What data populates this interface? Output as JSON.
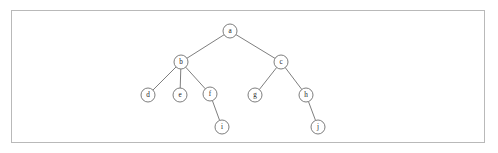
{
  "figure": {
    "type": "tree-diagram",
    "title": "",
    "caption": "",
    "frame": {
      "x": 11,
      "y": 10,
      "width": 474,
      "height": 133,
      "border_color": "#b9b9b9",
      "background_color": "#ffffff"
    },
    "style": {
      "node_fill": "#ffffff",
      "node_stroke": "#6f6f6f",
      "edge_stroke": "#6f6f6f",
      "node_radius": 7,
      "label_color": "#1d1d1d"
    }
  },
  "tree": {
    "root": "a",
    "nodes": [
      {
        "id": "a",
        "label": "a",
        "x": 230,
        "y": 31,
        "level": 0
      },
      {
        "id": "b",
        "label": "b",
        "x": 181,
        "y": 62,
        "level": 1
      },
      {
        "id": "c",
        "label": "c",
        "x": 281,
        "y": 62,
        "level": 1
      },
      {
        "id": "d",
        "label": "d",
        "x": 148,
        "y": 95,
        "level": 2
      },
      {
        "id": "e",
        "label": "e",
        "x": 180,
        "y": 95,
        "level": 2
      },
      {
        "id": "f",
        "label": "f",
        "x": 210,
        "y": 94,
        "level": 2
      },
      {
        "id": "g",
        "label": "g",
        "x": 255,
        "y": 95,
        "level": 2
      },
      {
        "id": "h",
        "label": "h",
        "x": 306,
        "y": 95,
        "level": 2
      },
      {
        "id": "i",
        "label": "i",
        "x": 222,
        "y": 127,
        "level": 3
      },
      {
        "id": "j",
        "label": "j",
        "x": 318,
        "y": 127,
        "level": 3
      }
    ],
    "edges": [
      {
        "from": "a",
        "to": "b"
      },
      {
        "from": "a",
        "to": "c"
      },
      {
        "from": "b",
        "to": "d"
      },
      {
        "from": "b",
        "to": "e"
      },
      {
        "from": "b",
        "to": "f"
      },
      {
        "from": "c",
        "to": "g"
      },
      {
        "from": "c",
        "to": "h"
      },
      {
        "from": "f",
        "to": "i"
      },
      {
        "from": "h",
        "to": "j"
      }
    ]
  }
}
